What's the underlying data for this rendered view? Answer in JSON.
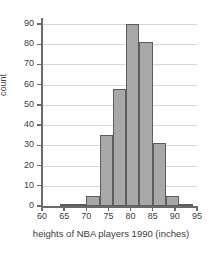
{
  "chart_data": {
    "type": "bar",
    "title": "",
    "subtitle": "",
    "xlabel": "heights of NBA players 1990 (inches)",
    "ylabel": "count",
    "xlim": [
      60,
      95
    ],
    "ylim": [
      0,
      92
    ],
    "bin_width": 3,
    "grid": true,
    "legend": null,
    "bar_color": "#a8a8a8",
    "bar_edge_color": "#5d5d5d",
    "axis_color": "#6a6a6a",
    "grid_color": "#d8d8d8",
    "xticks": [
      60,
      65,
      70,
      75,
      80,
      85,
      90,
      95
    ],
    "xtick_labels": [
      "60",
      "65",
      "70",
      "75",
      "80",
      "85",
      "90",
      "95"
    ],
    "yticks": [
      0,
      10,
      20,
      30,
      40,
      50,
      60,
      70,
      80,
      90
    ],
    "ytick_labels": [
      "0",
      "10",
      "20",
      "30",
      "40",
      "50",
      "60",
      "70",
      "80",
      "90"
    ],
    "bins": [
      {
        "start": 64,
        "end": 67,
        "value": 1
      },
      {
        "start": 67,
        "end": 70,
        "value": 1
      },
      {
        "start": 70,
        "end": 73,
        "value": 5
      },
      {
        "start": 73,
        "end": 76,
        "value": 35
      },
      {
        "start": 76,
        "end": 79,
        "value": 58
      },
      {
        "start": 79,
        "end": 82,
        "value": 90
      },
      {
        "start": 82,
        "end": 85,
        "value": 81
      },
      {
        "start": 85,
        "end": 88,
        "value": 31
      },
      {
        "start": 88,
        "end": 91,
        "value": 5
      },
      {
        "start": 91,
        "end": 94,
        "value": 1
      }
    ],
    "categories": [
      "64-67",
      "67-70",
      "70-73",
      "73-76",
      "76-79",
      "79-82",
      "82-85",
      "85-88",
      "88-91",
      "91-94"
    ],
    "values": [
      1,
      1,
      5,
      35,
      58,
      90,
      81,
      31,
      5,
      1
    ]
  }
}
